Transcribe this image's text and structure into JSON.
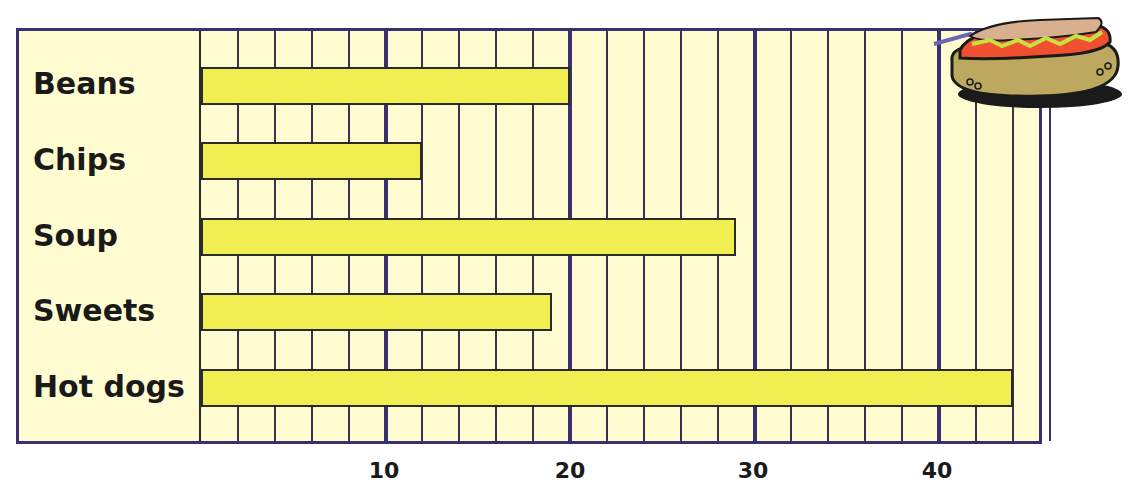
{
  "chart_data": {
    "type": "bar",
    "orientation": "horizontal",
    "title": "",
    "xlabel": "",
    "ylabel": "",
    "categories": [
      "Beans",
      "Chips",
      "Soup",
      "Sweets",
      "Hot dogs"
    ],
    "values": [
      20,
      12,
      29,
      19,
      44
    ],
    "xlim": [
      0,
      46
    ],
    "x_ticks": [
      10,
      20,
      30,
      40
    ],
    "minor_grid_step": 2,
    "grid": true,
    "legend": null,
    "colors": {
      "bar": "#f0ee50",
      "background": "#fefcd0",
      "frame": "#3a3070"
    },
    "decoration": "hot-dog illustration top-right"
  },
  "labels": [
    "Beans",
    "Chips",
    "Soup",
    "Sweets",
    "Hot dogs"
  ],
  "ticks": [
    "10",
    "20",
    "30",
    "40"
  ]
}
